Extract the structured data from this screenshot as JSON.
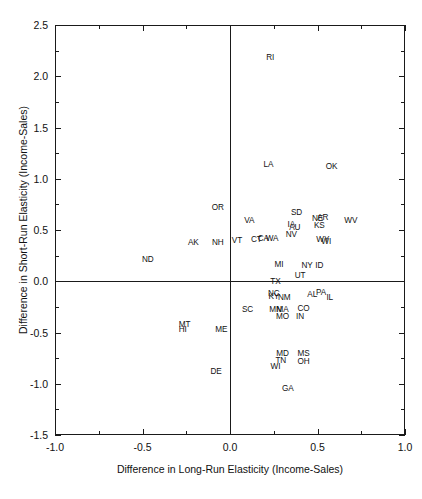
{
  "chart_data": {
    "type": "scatter",
    "title": "",
    "xlabel": "Difference in Long-Run Elasticity (Income-Sales)",
    "ylabel": "Difference in Short-Run Elasticity (Income-Sales)",
    "xlim": [
      -1.0,
      1.0
    ],
    "ylim": [
      -1.5,
      2.5
    ],
    "xticks": [
      "-1.0",
      "-0.5",
      "0.0",
      "0.5",
      "1.0"
    ],
    "xtick_values": [
      -1.0,
      -0.5,
      0.0,
      0.5,
      1.0
    ],
    "xminor_values": [
      -0.75,
      -0.25,
      0.25,
      0.75
    ],
    "yticks": [
      "2.5",
      "2.0",
      "1.5",
      "1.0",
      "0.5",
      "0.0",
      "-0.5",
      "-1.0",
      "-1.5"
    ],
    "ytick_values": [
      2.5,
      2.0,
      1.5,
      1.0,
      0.5,
      0.0,
      -0.5,
      -1.0,
      -1.5
    ],
    "yminor_values": [
      2.25,
      1.75,
      1.25,
      0.75,
      0.25,
      -0.25,
      -0.75,
      -1.25
    ],
    "grid": false,
    "legend": null,
    "reference_lines": [
      {
        "axis": "x",
        "value": 0.0
      },
      {
        "axis": "y",
        "value": 0.0
      }
    ],
    "point_label_style": "state-abbreviation",
    "points": [
      {
        "label": "RI",
        "x": 0.23,
        "y": 2.19
      },
      {
        "label": "LA",
        "x": 0.22,
        "y": 1.14
      },
      {
        "label": "OK",
        "x": 0.58,
        "y": 1.12
      },
      {
        "label": "OR",
        "x": -0.07,
        "y": 0.72
      },
      {
        "label": "SD",
        "x": 0.38,
        "y": 0.68
      },
      {
        "label": "VA",
        "x": 0.11,
        "y": 0.6
      },
      {
        "label": "NE",
        "x": 0.5,
        "y": 0.62
      },
      {
        "label": "AR",
        "x": 0.53,
        "y": 0.63
      },
      {
        "label": "WV",
        "x": 0.69,
        "y": 0.6
      },
      {
        "label": "IA",
        "x": 0.35,
        "y": 0.56
      },
      {
        "label": "AU",
        "x": 0.37,
        "y": 0.53
      },
      {
        "label": "KS",
        "x": 0.51,
        "y": 0.55
      },
      {
        "label": "NV",
        "x": 0.35,
        "y": 0.46
      },
      {
        "label": "VT",
        "x": 0.04,
        "y": 0.4
      },
      {
        "label": "CT",
        "x": 0.15,
        "y": 0.41
      },
      {
        "label": "CA",
        "x": 0.19,
        "y": 0.42
      },
      {
        "label": "WA",
        "x": 0.24,
        "y": 0.42
      },
      {
        "label": "AK",
        "x": -0.21,
        "y": 0.38
      },
      {
        "label": "NH",
        "x": -0.07,
        "y": 0.38
      },
      {
        "label": "WY",
        "x": 0.53,
        "y": 0.41
      },
      {
        "label": "WI",
        "x": 0.55,
        "y": 0.39
      },
      {
        "label": "ND",
        "x": -0.47,
        "y": 0.22
      },
      {
        "label": "MI",
        "x": 0.28,
        "y": 0.17
      },
      {
        "label": "NY",
        "x": 0.44,
        "y": 0.16
      },
      {
        "label": "ID",
        "x": 0.51,
        "y": 0.16
      },
      {
        "label": "UT",
        "x": 0.4,
        "y": 0.06
      },
      {
        "label": "TX",
        "x": 0.26,
        "y": 0.0
      },
      {
        "label": "NC",
        "x": 0.25,
        "y": -0.11
      },
      {
        "label": "KY",
        "x": 0.25,
        "y": -0.14
      },
      {
        "label": "NM",
        "x": 0.31,
        "y": -0.15
      },
      {
        "label": "AL",
        "x": 0.47,
        "y": -0.12
      },
      {
        "label": "PA",
        "x": 0.52,
        "y": -0.1
      },
      {
        "label": "IL",
        "x": 0.57,
        "y": -0.15
      },
      {
        "label": "SC",
        "x": 0.1,
        "y": -0.27
      },
      {
        "label": "MN",
        "x": 0.26,
        "y": -0.27
      },
      {
        "label": "MA",
        "x": 0.3,
        "y": -0.27
      },
      {
        "label": "CO",
        "x": 0.42,
        "y": -0.26
      },
      {
        "label": "MO",
        "x": 0.3,
        "y": -0.34
      },
      {
        "label": "IN",
        "x": 0.4,
        "y": -0.34
      },
      {
        "label": "MT",
        "x": -0.26,
        "y": -0.42
      },
      {
        "label": "HI",
        "x": -0.27,
        "y": -0.47
      },
      {
        "label": "ME",
        "x": -0.05,
        "y": -0.47
      },
      {
        "label": "MD",
        "x": 0.3,
        "y": -0.7
      },
      {
        "label": "MS",
        "x": 0.42,
        "y": -0.7
      },
      {
        "label": "TN",
        "x": 0.29,
        "y": -0.77
      },
      {
        "label": "OH",
        "x": 0.42,
        "y": -0.78
      },
      {
        "label": "WI",
        "x": 0.26,
        "y": -0.83
      },
      {
        "label": "DE",
        "x": -0.08,
        "y": -0.88
      },
      {
        "label": "GA",
        "x": 0.33,
        "y": -1.04
      }
    ]
  }
}
